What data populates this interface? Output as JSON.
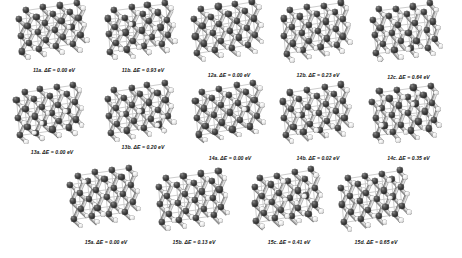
{
  "figure": {
    "type": "crystal-structure-grid",
    "background_color": "#ffffff",
    "atom_colors": {
      "dark_species": "#303030",
      "light_species": "#ededed"
    },
    "energy_symbol": "ΔE",
    "energy_unit": "eV",
    "rows": [
      {
        "row_id": "row-1",
        "cells": [
          {
            "id": "11a",
            "label": "11a.  ΔE = 0.00 eV",
            "structure_id": "11a",
            "delta_e": "0.00",
            "unit": "eV",
            "group": "11"
          },
          {
            "id": "11b",
            "label": "11b.  ΔE = 0.93 eV",
            "structure_id": "11b",
            "delta_e": "0.93",
            "unit": "eV",
            "group": "11"
          },
          {
            "id": "12a",
            "label": "12a.  ΔE = 0.00 eV",
            "structure_id": "12a",
            "delta_e": "0.00",
            "unit": "eV",
            "group": "12"
          },
          {
            "id": "12b",
            "label": "12b.  ΔE = 0.23 eV",
            "structure_id": "12b",
            "delta_e": "0.23",
            "unit": "eV",
            "group": "12"
          },
          {
            "id": "12c",
            "label": "12c.  ΔE = 0.64 eV",
            "structure_id": "12c",
            "delta_e": "0.64",
            "unit": "eV",
            "group": "12"
          }
        ]
      },
      {
        "row_id": "row-2",
        "cells": [
          {
            "id": "13a",
            "label": "13a.  ΔE = 0.00 eV",
            "structure_id": "13a",
            "delta_e": "0.00",
            "unit": "eV",
            "group": "13"
          },
          {
            "id": "13b",
            "label": "13b.  ΔE = 0.20 eV",
            "structure_id": "13b",
            "delta_e": "0.20",
            "unit": "eV",
            "group": "13"
          },
          {
            "id": "14a",
            "label": "14a.  ΔE = 0.00 eV",
            "structure_id": "14a",
            "delta_e": "0.00",
            "unit": "eV",
            "group": "14"
          },
          {
            "id": "14b",
            "label": "14b.  ΔE = 0.02 eV",
            "structure_id": "14b",
            "delta_e": "0.02",
            "unit": "eV",
            "group": "14"
          },
          {
            "id": "14c",
            "label": "14c.  ΔE = 0.35 eV",
            "structure_id": "14c",
            "delta_e": "0.35",
            "unit": "eV",
            "group": "14"
          }
        ]
      },
      {
        "row_id": "row-3",
        "cells": [
          {
            "id": "15a",
            "label": "15a.  ΔE =  0.00 eV",
            "structure_id": "15a",
            "delta_e": "0.00",
            "unit": "eV",
            "group": "15"
          },
          {
            "id": "15b",
            "label": "15b.  ΔE = 0.13 eV",
            "structure_id": "15b",
            "delta_e": "0.13",
            "unit": "eV",
            "group": "15"
          },
          {
            "id": "15c",
            "label": "15c.  ΔE = 0.41 eV",
            "structure_id": "15c",
            "delta_e": "0.41",
            "unit": "eV",
            "group": "15"
          },
          {
            "id": "15d",
            "label": "15d.  ΔE = 0.65 eV",
            "structure_id": "15d",
            "delta_e": "0.65",
            "unit": "eV",
            "group": "15"
          }
        ]
      }
    ]
  }
}
